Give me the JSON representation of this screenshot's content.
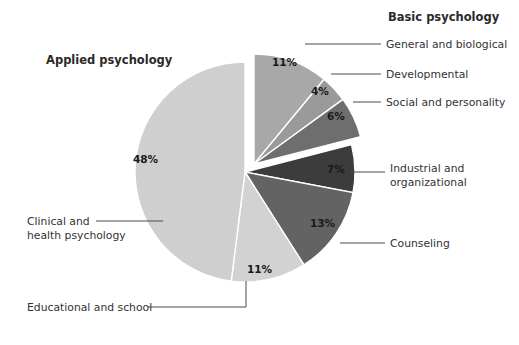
{
  "chart_data": {
    "type": "pie",
    "title": "",
    "groups": [
      {
        "name": "Basic psychology",
        "label": "Basic psychology"
      },
      {
        "name": "Applied psychology",
        "label": "Applied psychology"
      }
    ],
    "categories": [
      "General and biological",
      "Developmental",
      "Social and personality",
      "Industrial and organizational",
      "Counseling",
      "Educational and school",
      "Clinical and health psychology"
    ],
    "values": [
      11,
      4,
      6,
      7,
      13,
      11,
      48
    ],
    "value_labels": [
      "11%",
      "4%",
      "6%",
      "7%",
      "13%",
      "11%",
      "48%"
    ],
    "colors": [
      "#a8a8a8",
      "#9a9a9a",
      "#6e6e6e",
      "#3c3c3c",
      "#636363",
      "#d2d2d2",
      "#cfcfcf"
    ],
    "group_of": [
      "Basic psychology",
      "Basic psychology",
      "Basic psychology",
      "Applied psychology",
      "Applied psychology",
      "Applied psychology",
      "Applied psychology"
    ],
    "exploded": [
      true,
      true,
      true,
      false,
      false,
      false,
      false
    ],
    "legend_position": "callout-labels",
    "grid": false,
    "units": "percent"
  },
  "labels": {
    "group_basic": "Basic psychology",
    "group_applied": "Applied psychology",
    "general_biological": "General and biological",
    "developmental": "Developmental",
    "social_personality": "Social and personality",
    "industrial_line1": "Industrial and",
    "industrial_line2": "organizational",
    "counseling": "Counseling",
    "clinical_line1": "Clinical and",
    "clinical_line2": "health psychology",
    "educational_school": "Educational and school"
  },
  "percents": {
    "general_biological": "11%",
    "developmental": "4%",
    "social_personality": "6%",
    "industrial": "7%",
    "counseling": "13%",
    "educational": "11%",
    "clinical": "48%"
  },
  "colors": {
    "background": "#ffffff",
    "text": "#333333",
    "leader_line": "#4a4a4a",
    "slice_general": "#a8a8a8",
    "slice_developmental": "#9a9a9a",
    "slice_social": "#6e6e6e",
    "slice_industrial": "#3c3c3c",
    "slice_counseling": "#636363",
    "slice_educational": "#d2d2d2",
    "slice_clinical": "#cfcfcf"
  }
}
